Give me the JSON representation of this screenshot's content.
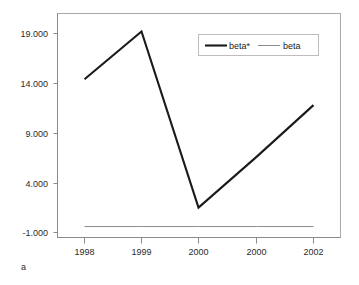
{
  "chart_data": {
    "type": "line",
    "title": "",
    "subtitle": "",
    "xlabel": "",
    "ylabel": "",
    "panel_label": "a",
    "categories": [
      "1998",
      "1999",
      "2000",
      "2001",
      "2002"
    ],
    "series": [
      {
        "name": "beta*",
        "values": [
          14.4,
          19.2,
          1.5,
          6.6,
          11.8
        ],
        "color": "#1a1a1a",
        "line_width": 2.1,
        "style": "solid"
      },
      {
        "name": "beta",
        "values": [
          -0.4,
          -0.4,
          -0.4,
          -0.4,
          -0.4
        ],
        "color": "#808080",
        "line_width": 0.9,
        "style": "solid"
      }
    ],
    "yticks": [
      19.0,
      14.0,
      9.0,
      4.0,
      -1.0
    ],
    "ytick_labels": [
      "19.000",
      "14.000",
      "9.000",
      "4.000",
      "-1.000"
    ],
    "xtick_labels": [
      "1998",
      "1999",
      "2000",
      "2001",
      "2002"
    ],
    "ylim": [
      -1.0,
      19.0
    ],
    "grid": false,
    "legend_position": "upper-right-inside",
    "legend_entries": [
      "beta*",
      "beta"
    ],
    "frame_color": "#999999",
    "axis_color": "#8a8a8a",
    "background": "#ffffff"
  },
  "axes": {
    "y_ticks": [
      {
        "label": "19.000",
        "value": 19.0
      },
      {
        "label": "14.000",
        "value": 14.0
      },
      {
        "label": "9.000",
        "value": 9.0
      },
      {
        "label": "4.000",
        "value": 4.0
      },
      {
        "label": "-1.000",
        "value": -1.0
      }
    ],
    "x_ticks": [
      {
        "label": "1998"
      },
      {
        "label": "1999"
      },
      {
        "label": "2000"
      },
      {
        "label": "2001"
      },
      {
        "label": "2002"
      }
    ]
  },
  "legend": {
    "items": [
      {
        "label": "beta*",
        "color": "#1a1a1a",
        "width": 2.1
      },
      {
        "label": "beta",
        "color": "#808080",
        "width": 0.9
      }
    ]
  },
  "caption": {
    "panel": "a"
  }
}
